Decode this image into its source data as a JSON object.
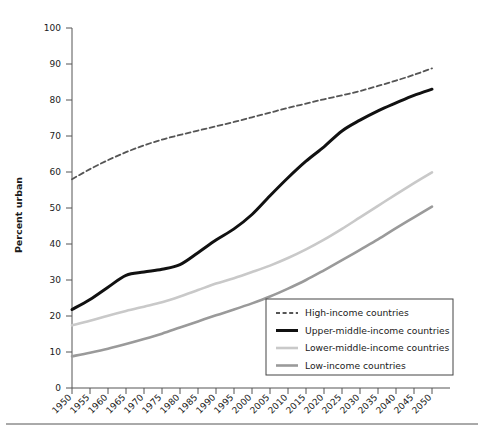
{
  "chart_data": {
    "type": "line",
    "title": "",
    "subtitle": "",
    "xlabel": "",
    "ylabel": "Percent urban",
    "xlim": [
      1950,
      2050
    ],
    "ylim": [
      0,
      100
    ],
    "grid": false,
    "legend_position": "bottom-right",
    "x": [
      1950,
      1955,
      1960,
      1965,
      1970,
      1975,
      1980,
      1985,
      1990,
      1995,
      2000,
      2005,
      2010,
      2015,
      2020,
      2025,
      2030,
      2035,
      2040,
      2045,
      2050
    ],
    "xticklabels": [
      "1950",
      "1955",
      "1960",
      "1965",
      "1970",
      "1975",
      "1980",
      "1985",
      "1990",
      "1995",
      "2000",
      "2005",
      "2010",
      "2015",
      "2020",
      "2025",
      "2030",
      "2035",
      "2040",
      "2045",
      "2050"
    ],
    "yticklabels": [
      "0",
      "10",
      "20",
      "30",
      "40",
      "50",
      "60",
      "70",
      "80",
      "90",
      "100"
    ],
    "yticks": [
      0,
      10,
      20,
      30,
      40,
      50,
      60,
      70,
      80,
      90,
      100
    ],
    "series": [
      {
        "name": "High-income countries",
        "style": "dashed",
        "color": "#555555",
        "width": 1.8,
        "values": [
          58.0,
          60.8,
          63.3,
          65.5,
          67.4,
          69.0,
          70.3,
          71.5,
          72.7,
          73.9,
          75.2,
          76.5,
          77.8,
          79.0,
          80.2,
          81.3,
          82.5,
          83.9,
          85.4,
          87.0,
          88.8
        ]
      },
      {
        "name": "Upper-middle-income countries",
        "style": "solid",
        "color": "#111111",
        "width": 3.0,
        "values": [
          21.8,
          24.6,
          28.0,
          31.3,
          32.2,
          33.0,
          34.3,
          37.6,
          41.1,
          44.2,
          48.2,
          53.4,
          58.4,
          63.0,
          67.0,
          71.4,
          74.4,
          77.0,
          79.2,
          81.3,
          83.0
        ]
      },
      {
        "name": "Lower-middle-income countries",
        "style": "solid",
        "color": "#c9c9c9",
        "width": 2.6,
        "values": [
          17.4,
          18.7,
          20.1,
          21.4,
          22.6,
          23.8,
          25.4,
          27.2,
          29.0,
          30.5,
          32.2,
          34.0,
          36.1,
          38.5,
          41.2,
          44.2,
          47.4,
          50.6,
          53.8,
          56.9,
          59.9
        ]
      },
      {
        "name": "Low-income countries",
        "style": "solid",
        "color": "#9a9a9a",
        "width": 2.6,
        "values": [
          8.8,
          9.8,
          10.9,
          12.2,
          13.6,
          15.1,
          16.8,
          18.5,
          20.2,
          21.8,
          23.5,
          25.4,
          27.6,
          30.0,
          32.7,
          35.5,
          38.4,
          41.3,
          44.4,
          47.4,
          50.4
        ]
      }
    ]
  },
  "axis": {
    "y_title": "Percent urban"
  },
  "legend": {
    "entries": [
      {
        "label": "High-income countries"
      },
      {
        "label": "Upper-middle-income countries"
      },
      {
        "label": "Lower-middle-income countries"
      },
      {
        "label": "Low-income countries"
      }
    ]
  }
}
